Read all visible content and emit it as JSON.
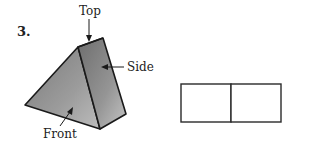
{
  "problem": {
    "number": "3."
  },
  "figure": {
    "labels": {
      "top": "Top",
      "side": "Side",
      "front": "Front"
    },
    "colors": {
      "front_face": "#9a9a9a",
      "side_face": "#8e8e8e",
      "top_face": "#c8c8c8",
      "outline": "#1a1a1a"
    }
  },
  "answer_grid": {
    "cells": 2,
    "outline_color": "#2a2a2a"
  }
}
